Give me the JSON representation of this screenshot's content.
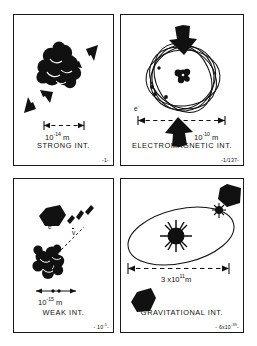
{
  "figure": {
    "panel_count": 4,
    "line_color": "#1a1a1a",
    "fill_color": "#000000",
    "background": "#ffffff"
  },
  "panels": [
    {
      "id": "strong",
      "title": "STRONG INT.",
      "strength_prefix": "-",
      "strength_value": "1",
      "strength_exponent": "",
      "strength_suffix": "-",
      "scale_mantissa": "10",
      "scale_exponent": "-14",
      "scale_unit": "m",
      "scale_text": "10-14 m",
      "objects": [
        {
          "name": "nucleus-cluster",
          "kind": "nucleons",
          "count": 11
        },
        {
          "name": "arrow-upper-right",
          "kind": "block-arrow",
          "direction": "down-left"
        },
        {
          "name": "arrow-lower-left",
          "kind": "block-arrow",
          "direction": "up-right"
        },
        {
          "name": "dimension-line",
          "kind": "dashed-dimension"
        }
      ],
      "symbols": []
    },
    {
      "id": "electromagnetic",
      "title": "ELECTROMAGNETIC INT.",
      "strength_prefix": "-",
      "strength_value": "1/137",
      "strength_exponent": "",
      "strength_suffix": "-",
      "scale_mantissa": "10",
      "scale_exponent": "-10",
      "scale_unit": "m",
      "scale_text": "10-10 m",
      "objects": [
        {
          "name": "atom-orbits",
          "kind": "ellipse-orbits",
          "count": 5
        },
        {
          "name": "nucleus-dot",
          "kind": "nucleus"
        },
        {
          "name": "electron-dots",
          "kind": "electrons",
          "count": 4
        },
        {
          "name": "arrow-top",
          "kind": "block-arrow",
          "direction": "down"
        },
        {
          "name": "arrow-bottom",
          "kind": "block-arrow",
          "direction": "up"
        },
        {
          "name": "dimension-line",
          "kind": "dashed-dimension"
        }
      ],
      "symbols": [
        {
          "name": "electron-label",
          "text": "e",
          "sup": "-"
        }
      ]
    },
    {
      "id": "weak",
      "title": "WEAK INT.",
      "strength_prefix": "-",
      "strength_value": "10",
      "strength_exponent": "-5",
      "strength_suffix": "-",
      "scale_mantissa": "10",
      "scale_exponent": "-15",
      "scale_unit": "m",
      "scale_text": "10-15 m",
      "objects": [
        {
          "name": "nucleus-cluster",
          "kind": "nucleons",
          "count": 9
        },
        {
          "name": "arrow-decay",
          "kind": "block-arrow",
          "direction": "up-left"
        },
        {
          "name": "decay-tracks",
          "kind": "dashed-tracks",
          "count": 3
        },
        {
          "name": "dimension-line",
          "kind": "dashed-dimension"
        }
      ],
      "symbols": [
        {
          "name": "electron-label",
          "text": "e",
          "sup": "-"
        },
        {
          "name": "antineutrino-label",
          "text": "v",
          "sup": "",
          "overline": true
        }
      ]
    },
    {
      "id": "gravitational",
      "title": "GRAVITATIONAL INT.",
      "strength_prefix": "-",
      "strength_value": "6x10",
      "strength_exponent": "-39",
      "strength_suffix": "-",
      "scale_mantissa": "3 x10",
      "scale_exponent": "11",
      "scale_unit": "m",
      "scale_text": "3 x1011 m",
      "objects": [
        {
          "name": "orbit-ellipse",
          "kind": "ellipse"
        },
        {
          "name": "sun-star",
          "kind": "star-burst"
        },
        {
          "name": "planet-earth",
          "kind": "planet"
        },
        {
          "name": "arrow-top-right",
          "kind": "block-arrow",
          "direction": "down-left"
        },
        {
          "name": "arrow-bottom-left",
          "kind": "block-arrow",
          "direction": "up-right"
        },
        {
          "name": "dimension-line",
          "kind": "dashed-dimension"
        }
      ],
      "symbols": []
    }
  ]
}
